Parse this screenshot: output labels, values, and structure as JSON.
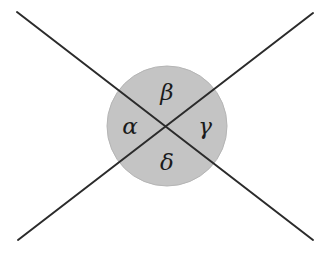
{
  "figure": {
    "canvas": {
      "width": 331,
      "height": 254
    },
    "background_color": "#ffffff",
    "line_color": "#2b2b2b",
    "line_width": 2,
    "label_color": "#1b1b1b",
    "disk": {
      "center_x": 167,
      "center_y": 126,
      "radius": 60,
      "fill_color": "#c4c4c4",
      "stroke_color": "#b5b5b5"
    },
    "lines": [
      {
        "name": "line-nw-se",
        "x1": 17,
        "y1": 12,
        "x2": 313,
        "y2": 240
      },
      {
        "name": "line-ne-sw",
        "x1": 313,
        "y1": 13,
        "x2": 18,
        "y2": 240
      }
    ],
    "labels": [
      {
        "symbol": "α",
        "name": "alpha",
        "position": "left",
        "x": 130,
        "y": 126
      },
      {
        "symbol": "β",
        "name": "beta",
        "position": "top",
        "x": 167,
        "y": 92
      },
      {
        "symbol": "γ",
        "name": "gamma",
        "position": "right",
        "x": 205,
        "y": 126
      },
      {
        "symbol": "δ",
        "name": "delta",
        "position": "bottom",
        "x": 167,
        "y": 162
      }
    ]
  }
}
